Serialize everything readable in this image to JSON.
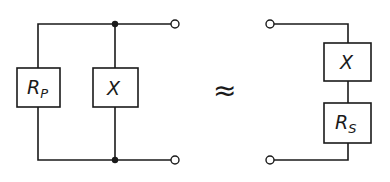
{
  "diagram": {
    "type": "circuit-equivalence",
    "left_circuit": {
      "topology": "parallel",
      "components": [
        {
          "id": "rp",
          "label_main": "R",
          "label_sub": "P"
        },
        {
          "id": "x_parallel",
          "label_main": "X",
          "label_sub": ""
        }
      ],
      "terminals": 2,
      "junction_dots": 2
    },
    "relation_symbol": "≈",
    "right_circuit": {
      "topology": "series",
      "components": [
        {
          "id": "x_series",
          "label_main": "X",
          "label_sub": ""
        },
        {
          "id": "rs",
          "label_main": "R",
          "label_sub": "S"
        }
      ],
      "terminals": 2
    },
    "colors": {
      "line": "#1a1a1a",
      "background": "#ffffff"
    }
  }
}
